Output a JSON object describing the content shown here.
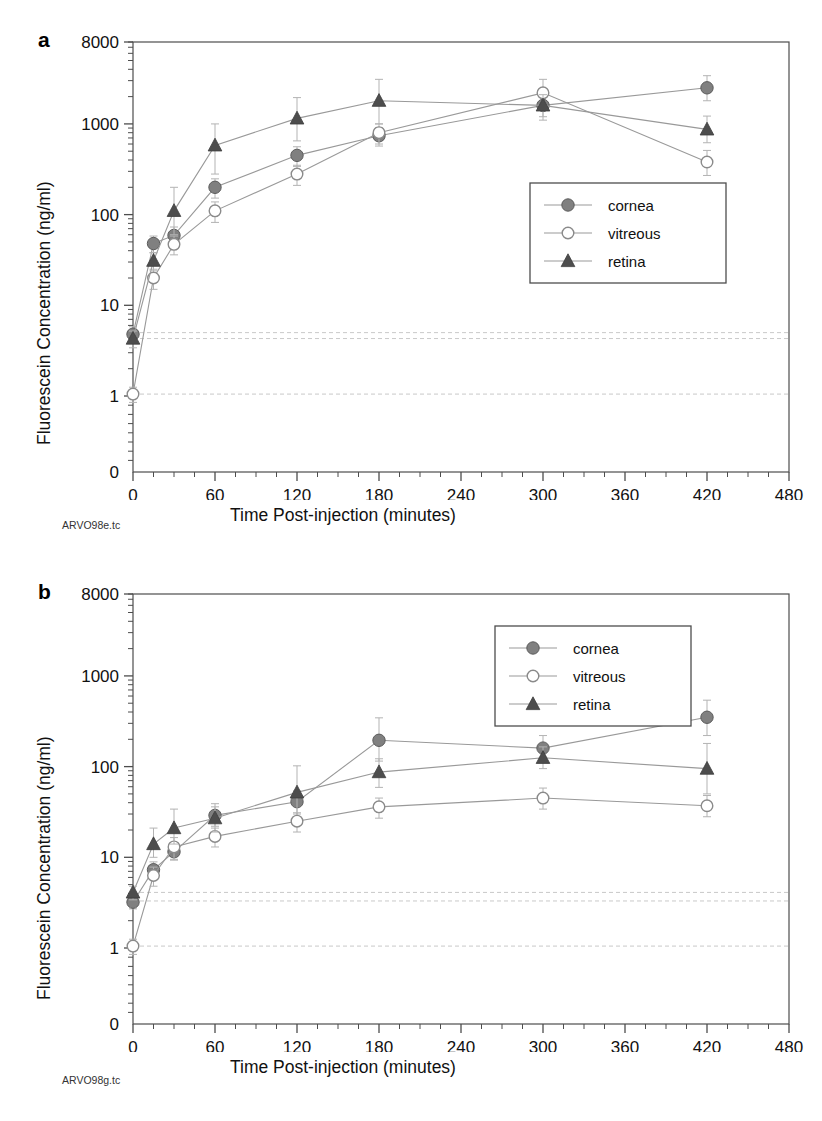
{
  "figure": {
    "panels": [
      {
        "letter": "a",
        "file_code": "ARVO98e.tc",
        "xlabel": "Time Post-injection (minutes)",
        "ylabel": "Fluorescein Concentration (ng/ml)"
      },
      {
        "letter": "b",
        "file_code": "ARVO98g.tc",
        "xlabel": "Time Post-injection (minutes)",
        "ylabel": "Fluorescein Concentration (ng/ml)"
      }
    ],
    "colors": {
      "cornea_marker": "#808080",
      "vitreous_marker": "#ffffff",
      "retina_marker": "#4d4d4d",
      "line": "#999999",
      "axis": "#4d4d4d",
      "baseline_dash": "#c9c9c9",
      "text": "#111111"
    }
  },
  "chart_data": [
    {
      "type": "line",
      "panel": "a",
      "title": "",
      "xlabel": "Time Post-injection (minutes)",
      "ylabel": "Fluorescein Concentration (ng/ml)",
      "xlim": [
        0,
        480
      ],
      "ylim": [
        1,
        8000
      ],
      "yscale": "log",
      "xticks": [
        0,
        60,
        120,
        180,
        240,
        300,
        360,
        420,
        480
      ],
      "xtick_labels": [
        "0",
        "60",
        "120",
        "180",
        "240",
        "300",
        "360",
        "420",
        "480"
      ],
      "x_minor_tick_step": 15,
      "yticks": [
        1,
        10,
        100,
        1000,
        8000
      ],
      "ytick_labels": [
        "1",
        "10",
        "100",
        "1000",
        "8000"
      ],
      "y_zero_label": "0",
      "grid": false,
      "legend_position": "right-middle",
      "legend": [
        "cornea",
        "vitreous",
        "retina"
      ],
      "x": [
        0,
        15,
        30,
        60,
        120,
        180,
        300,
        420
      ],
      "series": [
        {
          "name": "cornea",
          "marker": "filled-circle",
          "values": [
            4.8,
            48,
            59,
            200,
            450,
            740,
            1600,
            2500
          ],
          "err_up": [
            1.0,
            10,
            14,
            48,
            110,
            170,
            700,
            900
          ],
          "err_down": [
            1.0,
            10,
            14,
            48,
            110,
            170,
            500,
            700
          ]
        },
        {
          "name": "vitreous",
          "marker": "open-circle",
          "values": [
            1.05,
            20,
            47,
            110,
            280,
            800,
            2200,
            380
          ],
          "err_up": [
            0.2,
            5,
            11,
            28,
            70,
            200,
            900,
            130
          ],
          "err_down": [
            0.2,
            5,
            11,
            28,
            70,
            200,
            700,
            110
          ]
        },
        {
          "name": "retina",
          "marker": "filled-triangle",
          "values": [
            4.3,
            31,
            110,
            580,
            1150,
            1800,
            1600,
            870
          ],
          "err_up": [
            0.9,
            7,
            90,
            420,
            800,
            1300,
            500,
            350
          ],
          "err_down": [
            0.9,
            7,
            50,
            300,
            500,
            800,
            400,
            250
          ]
        }
      ],
      "reference_lines": [
        5.0,
        4.3,
        1.05
      ]
    },
    {
      "type": "line",
      "panel": "b",
      "title": "",
      "xlabel": "Time Post-injection (minutes)",
      "ylabel": "Fluorescein Concentration (ng/ml)",
      "xlim": [
        0,
        480
      ],
      "ylim": [
        1,
        8000
      ],
      "yscale": "log",
      "xticks": [
        0,
        60,
        120,
        180,
        240,
        300,
        360,
        420,
        480
      ],
      "xtick_labels": [
        "0",
        "60",
        "120",
        "180",
        "240",
        "300",
        "360",
        "420",
        "480"
      ],
      "x_minor_tick_step": 15,
      "yticks": [
        1,
        10,
        100,
        1000,
        8000
      ],
      "ytick_labels": [
        "1",
        "10",
        "100",
        "1000",
        "8000"
      ],
      "y_zero_label": "0",
      "grid": false,
      "legend_position": "top-right",
      "legend": [
        "cornea",
        "vitreous",
        "retina"
      ],
      "x": [
        0,
        15,
        30,
        60,
        120,
        180,
        300,
        420
      ],
      "series": [
        {
          "name": "cornea",
          "marker": "filled-circle",
          "values": [
            3.2,
            7.3,
            11.5,
            29,
            41,
            195,
            160,
            350
          ],
          "err_up": [
            0.5,
            1.6,
            2.2,
            7,
            13,
            150,
            60,
            190
          ],
          "err_down": [
            0.5,
            1.6,
            2.2,
            7,
            13,
            80,
            45,
            130
          ]
        },
        {
          "name": "vitreous",
          "marker": "open-circle",
          "values": [
            1.05,
            6.3,
            13,
            17,
            25,
            36,
            45,
            37
          ],
          "err_up": [
            0.2,
            1.5,
            3.5,
            4,
            6,
            9,
            13,
            11
          ],
          "err_down": [
            0.2,
            1.5,
            3.5,
            4,
            6,
            9,
            11,
            9
          ]
        },
        {
          "name": "retina",
          "marker": "filled-triangle",
          "values": [
            4.1,
            14,
            21,
            27,
            52,
            87,
            125,
            95
          ],
          "err_up": [
            0.7,
            7,
            13,
            12,
            50,
            35,
            40,
            85
          ],
          "err_down": [
            0.7,
            4,
            7,
            8,
            22,
            28,
            30,
            45
          ]
        }
      ],
      "reference_lines": [
        4.1,
        3.3,
        1.05
      ]
    }
  ]
}
